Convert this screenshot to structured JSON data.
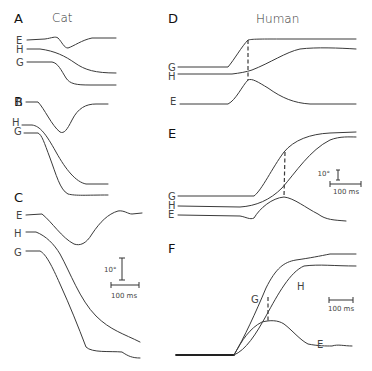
{
  "figure": {
    "groups": [
      {
        "title": "Cat",
        "panels": [
          "A",
          "B",
          "C"
        ]
      },
      {
        "title": "Human",
        "panels": [
          "D",
          "E",
          "F"
        ]
      }
    ],
    "panels": {
      "A": {
        "label": "A",
        "trace_labels": [
          "E",
          "H",
          "G"
        ]
      },
      "B": {
        "label": "B",
        "trace_labels": [
          "E",
          "H",
          "G"
        ]
      },
      "C": {
        "label": "C",
        "trace_labels": [
          "E",
          "H",
          "G"
        ]
      },
      "D": {
        "label": "D",
        "trace_labels": [
          "G",
          "H",
          "E"
        ]
      },
      "E": {
        "label": "E",
        "trace_labels": [
          "G",
          "H",
          "E"
        ]
      },
      "F": {
        "label": "F",
        "trace_labels": [
          "G",
          "H",
          "E"
        ]
      }
    },
    "scale_bars": {
      "cat": {
        "angle": "10°",
        "time": "100 ms"
      },
      "human_E": {
        "angle": "10°",
        "time": "100 ms"
      },
      "human_F": {
        "time": "100 ms"
      }
    },
    "legend": {
      "E": "eye",
      "H": "head",
      "G": "gaze"
    }
  }
}
